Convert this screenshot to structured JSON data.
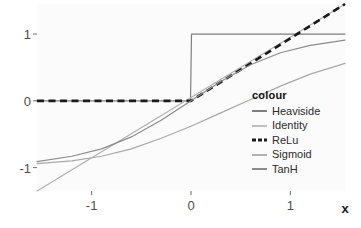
{
  "chart_data": {
    "type": "line",
    "title": "",
    "xlabel": "x",
    "ylabel": "",
    "xlim": [
      -1.55,
      1.55
    ],
    "ylim": [
      -1.35,
      1.45
    ],
    "xticks": [
      -1,
      0,
      1
    ],
    "xtick_labels": [
      "-1",
      "0",
      "1"
    ],
    "yticks": [
      -1,
      0,
      1
    ],
    "ytick_labels": [
      "-1",
      "0",
      "1"
    ],
    "grid": false,
    "legend_position": "inside-bottom-right",
    "legend_title": "colour",
    "series": [
      {
        "name": "Heaviside",
        "color": "#7f7f7f",
        "dash": "solid",
        "width": 1.2,
        "x": [
          -1.55,
          -0.005,
          0.005,
          1.55
        ],
        "y": [
          0,
          0,
          1,
          1
        ]
      },
      {
        "name": "Identity",
        "color": "#b0b0b0",
        "dash": "solid",
        "width": 1.2,
        "x": [
          -1.55,
          1.55
        ],
        "y": [
          -1.55,
          1.55
        ]
      },
      {
        "name": "ReLu",
        "color": "#1a1a1a",
        "dash": "dashed",
        "width": 2.6,
        "x": [
          -1.55,
          0,
          1.55
        ],
        "y": [
          0,
          0,
          1.55
        ]
      },
      {
        "name": "Sigmoid",
        "color": "#a8a8a8",
        "dash": "solid",
        "width": 1.2,
        "x": [
          -1.55,
          -1.2,
          -0.9,
          -0.6,
          -0.3,
          0,
          0.3,
          0.6,
          0.9,
          1.2,
          1.55
        ],
        "y": [
          -0.94,
          -0.9,
          -0.83,
          -0.72,
          -0.56,
          -0.38,
          -0.18,
          0.02,
          0.22,
          0.4,
          0.56
        ]
      },
      {
        "name": "TanH",
        "color": "#8c8c8c",
        "dash": "solid",
        "width": 1.2,
        "x": [
          -1.55,
          -1.2,
          -0.9,
          -0.6,
          -0.3,
          0,
          0.3,
          0.6,
          0.9,
          1.2,
          1.55
        ],
        "y": [
          -0.91,
          -0.83,
          -0.72,
          -0.54,
          -0.29,
          0,
          0.29,
          0.54,
          0.72,
          0.83,
          0.91
        ]
      }
    ]
  },
  "legend": {
    "title": "colour",
    "items": [
      {
        "label": "Heaviside",
        "color": "#7f7f7f",
        "dash": "solid",
        "thickness": 2
      },
      {
        "label": "Identity",
        "color": "#c0c0c0",
        "dash": "solid",
        "thickness": 2
      },
      {
        "label": "ReLu",
        "color": "#1a1a1a",
        "dash": "dashed",
        "thickness": 3
      },
      {
        "label": "Sigmoid",
        "color": "#b3b3b3",
        "dash": "solid",
        "thickness": 2
      },
      {
        "label": "TanH",
        "color": "#8c8c8c",
        "dash": "solid",
        "thickness": 2
      }
    ]
  },
  "axes": {
    "x_title": "x",
    "x_tick_labels": [
      "-1",
      "0",
      "1"
    ],
    "y_tick_labels": [
      "1",
      "0",
      "-1"
    ]
  },
  "style": {
    "panel_background": "#fbfbfb",
    "page_background": "#ffffff",
    "tick_text_color": "#4d4d4d",
    "axis_title_color": "#1a1a1a"
  }
}
